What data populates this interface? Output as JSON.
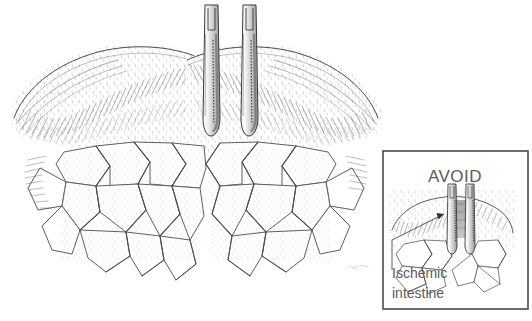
{
  "figure": {
    "type": "medical-line-illustration",
    "title_visible": false,
    "background_color": "#ffffff",
    "ink_color": "#3a3a3a",
    "view": "anterior"
  },
  "main_scene": {
    "name": "bowel-loops-with-clamps",
    "bowel_loops": [
      {
        "side": "left",
        "label_visible": false
      },
      {
        "side": "right",
        "label_visible": false
      }
    ],
    "instruments": [
      {
        "name": "stapler-clamp-left",
        "orientation": "vertical",
        "jaw_tip_y": 135
      },
      {
        "name": "stapler-clamp-right",
        "orientation": "vertical",
        "jaw_tip_y": 135
      }
    ],
    "mesentery": {
      "name": "mesenteric-vascular-arcades",
      "description": "polygonal arcade network of paired vessel lines"
    }
  },
  "inset": {
    "name": "avoid-inset-panel",
    "border_color": "#4a4a4a",
    "heading": "AVOID",
    "callout_lines": [
      "Ischemic",
      "intestine"
    ],
    "callout_full": "Ischemic intestine",
    "leader": {
      "name": "leader-arrow",
      "points_to": "ischemic-bowel-segment"
    },
    "instruments": [
      {
        "name": "inset-clamp-left"
      },
      {
        "name": "inset-clamp-right"
      }
    ]
  },
  "signature": {
    "name": "artist-signature",
    "text": "",
    "legible": false
  },
  "colors": {
    "ink": "#3a3a3a",
    "light_ink": "#8f8f8f",
    "hatch": "#707070",
    "text": "#5b5b5b",
    "frame": "#4a4a4a",
    "background": "#ffffff",
    "ischemic_shade": "#5a5a5a"
  }
}
